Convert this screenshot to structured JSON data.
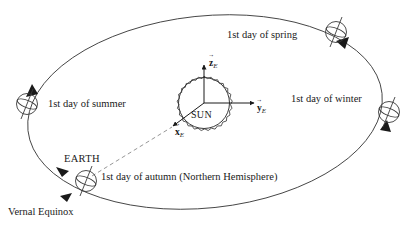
{
  "figure": {
    "background_color": "#ffffff",
    "stroke_color": "#2a2a2a",
    "text_color": "#1a1a1a"
  },
  "sun": {
    "label": "SUN",
    "center": [
      204,
      103
    ],
    "radius": 26
  },
  "axes": {
    "frame_subscript": "E",
    "z": {
      "letter": "z",
      "subscript": "E",
      "direction": "up"
    },
    "y": {
      "letter": "y",
      "subscript": "E",
      "direction": "right"
    },
    "x": {
      "letter": "x",
      "subscript": "E",
      "direction": "down-left"
    }
  },
  "orbit": {
    "type": "ellipse",
    "center": [
      205,
      112
    ],
    "rx": 178,
    "ry": 96,
    "rotation_deg": -6
  },
  "positions": [
    {
      "id": "summer",
      "label": "1st day of summer",
      "earth_center": [
        27,
        104
      ],
      "label_x": 48,
      "label_y": 99
    },
    {
      "id": "spring",
      "label": "1st day of spring",
      "earth_center": [
        336,
        32
      ],
      "label_x": 227,
      "label_y": 30
    },
    {
      "id": "winter",
      "label": "1st day of winter",
      "earth_center": [
        389,
        112
      ],
      "label_x": 291,
      "label_y": 94
    },
    {
      "id": "autumn",
      "label": "1st day of autumn (Northern Hemisphere)",
      "earth_center": [
        86,
        181
      ],
      "label_x": 101,
      "label_y": 172
    }
  ],
  "annotations": {
    "earth_label": "EARTH",
    "earth_label_x": 64,
    "earth_label_y": 154,
    "vernal_equinox_label": "Vernal Equinox",
    "vernal_equinox_x": 8,
    "vernal_equinox_y": 207
  }
}
